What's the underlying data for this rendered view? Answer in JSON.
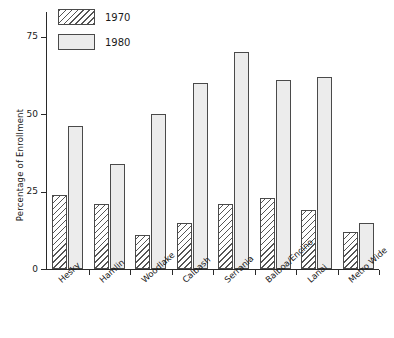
{
  "chart_data": {
    "type": "bar",
    "title": "",
    "subtitle": "",
    "xlabel": "",
    "ylabel": "Percentage of Enrollment",
    "ylim": [
      0,
      80
    ],
    "yticks": [
      0,
      25,
      50,
      75
    ],
    "ytick_labels": [
      "0",
      "25",
      "50",
      "75"
    ],
    "grid": false,
    "legend_position": "top-left",
    "categories": [
      "Hesky",
      "Hamlin",
      "Woodlake",
      "Calbash",
      "Serrania",
      "Balboa/Encino",
      "Lanai",
      "Metro Wide"
    ],
    "series": [
      {
        "name": "1970",
        "pattern": "diagonal-hatch",
        "color": "#ffffff",
        "values": [
          24,
          21,
          11,
          15,
          21,
          23,
          19,
          12
        ]
      },
      {
        "name": "1980",
        "pattern": "light-stipple",
        "color": "#ececec",
        "values": [
          46,
          34,
          50,
          60,
          70,
          61,
          62,
          15
        ]
      }
    ]
  },
  "legend": {
    "items": [
      {
        "label": "1970"
      },
      {
        "label": "1980"
      }
    ]
  },
  "axes": {
    "y_title": "Percentage of Enrollment"
  }
}
